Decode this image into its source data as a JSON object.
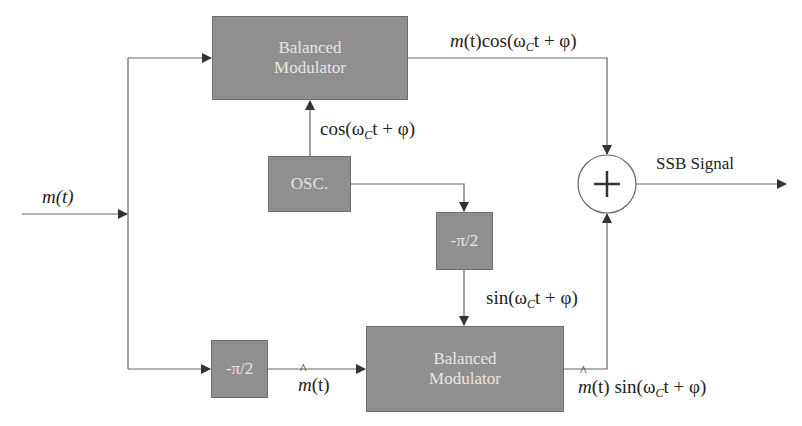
{
  "diagram": {
    "colors": {
      "block_fill": "#8f8f8f",
      "block_text": "#e6e6e6",
      "line": "#555555",
      "background": "#ffffff"
    },
    "blocks": {
      "top_modulator": {
        "line1": "Balanced",
        "line2": "Modulator"
      },
      "oscillator": {
        "label": "OSC."
      },
      "carrier_phase_shifter": {
        "label": "-π/2"
      },
      "message_phase_shifter": {
        "label": "-π/2"
      },
      "bottom_modulator": {
        "line1": "Balanced",
        "line2": "Modulator"
      },
      "summer": {
        "symbol": "+"
      }
    },
    "signals": {
      "input": "m(t)",
      "top_output": {
        "m": "m",
        "t_part": "(t)",
        "cos": "cos(ω",
        "sub": "C",
        "rest": "t + φ)"
      },
      "carrier_cos": {
        "cos": "cos(ω",
        "sub": "C",
        "rest": "t + φ)"
      },
      "carrier_sin": {
        "sin": "sin(ω",
        "sub": "C",
        "rest": "t + φ)"
      },
      "hilbert_message": {
        "m": "m",
        "t_part": "(t)"
      },
      "bottom_output": {
        "m": "m",
        "t_part": "(t)",
        "sin": " sin(ω",
        "sub": "C",
        "rest": "t + φ)"
      },
      "output": "SSB Signal"
    }
  }
}
